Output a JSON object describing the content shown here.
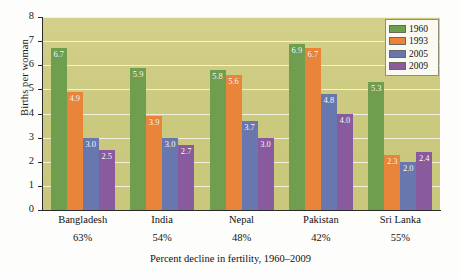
{
  "chart_data": {
    "type": "bar",
    "title": "",
    "xlabel": "Percent decline in fertility, 1960–2009",
    "ylabel": "Births per woman",
    "ylim": [
      0,
      8
    ],
    "yticks": [
      0,
      1,
      2,
      3,
      4,
      5,
      6,
      7,
      8
    ],
    "grid": true,
    "legend_position": "top-right",
    "categories": [
      "Bangladesh",
      "India",
      "Nepal",
      "Pakistan",
      "Sri Lanka"
    ],
    "category_sublabels": [
      "63%",
      "54%",
      "48%",
      "42%",
      "55%"
    ],
    "series": [
      {
        "name": "1960",
        "color": "#6f9e4e",
        "values": [
          6.7,
          5.9,
          5.8,
          6.9,
          5.3
        ]
      },
      {
        "name": "1993",
        "color": "#e8853a",
        "values": [
          4.9,
          3.9,
          5.6,
          6.7,
          2.3
        ]
      },
      {
        "name": "2005",
        "color": "#6878ae",
        "values": [
          3.0,
          3.0,
          3.7,
          4.8,
          2.0
        ]
      },
      {
        "name": "2009",
        "color": "#8a5a9e",
        "values": [
          2.5,
          2.7,
          3.0,
          4.0,
          2.4
        ]
      }
    ],
    "value_label_format": "one-decimal",
    "plot_background_color": "#cfcd85",
    "gridline_color": "#f3f1dd",
    "axis_color": "#2b2b2b",
    "value_label_color": "#ffffff"
  }
}
